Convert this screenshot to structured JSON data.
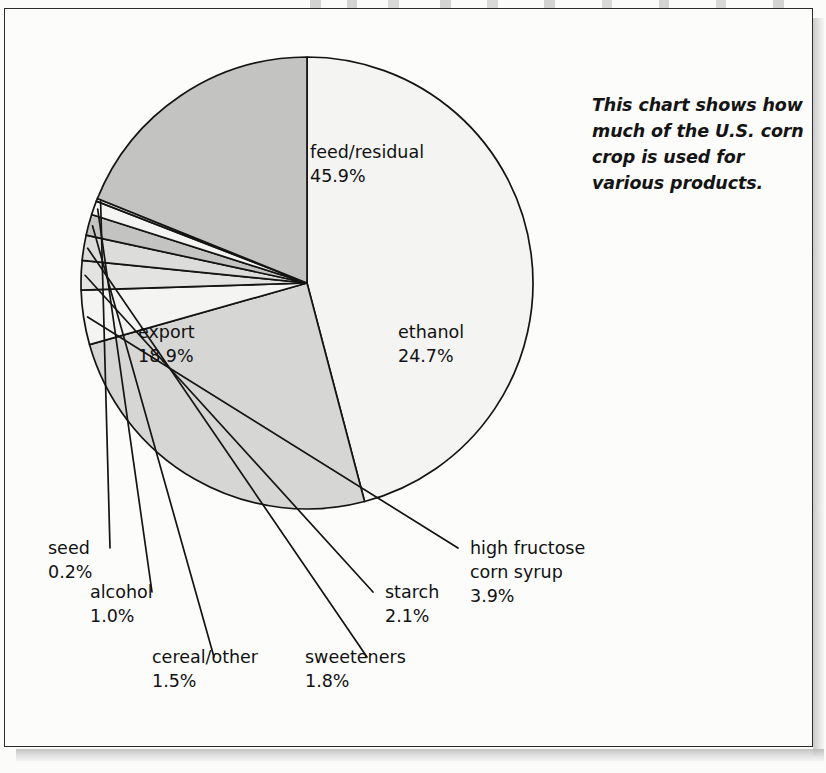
{
  "caption": {
    "text": "This chart shows how much of the U.S. corn crop is used for various products."
  },
  "chart_data": {
    "type": "pie",
    "title": "",
    "subtitle": "",
    "xlabel": "",
    "ylabel": "",
    "legend_position": "none",
    "grid": false,
    "units": "percent",
    "note": "This chart shows how much of the U.S. corn crop is used for various products.",
    "categories": [
      "feed/residual",
      "ethanol",
      "high fructose corn syrup",
      "starch",
      "sweeteners",
      "cereal/other",
      "alcohol",
      "seed",
      "export"
    ],
    "values": [
      45.9,
      24.7,
      3.9,
      2.1,
      1.8,
      1.5,
      1.0,
      0.2,
      18.9
    ],
    "slices": [
      {
        "name": "feed/residual",
        "label": "feed/residual",
        "percent": "45.9%",
        "value": 45.9,
        "fill": "#f4f4f2",
        "label_placement": "inside",
        "label_x": 310,
        "label_y": 158
      },
      {
        "name": "ethanol",
        "label": "ethanol",
        "percent": "24.7%",
        "value": 24.7,
        "fill": "#d6d6d4",
        "label_placement": "inside",
        "label_x": 398,
        "label_y": 338
      },
      {
        "name": "high-fructose-corn-syrup",
        "label": "high fructose",
        "label_line2": "corn syrup",
        "percent": "3.9%",
        "value": 3.9,
        "fill": "#f4f4f2",
        "label_placement": "callout",
        "label_x": 470,
        "label_y": 554
      },
      {
        "name": "starch",
        "label": "starch",
        "percent": "2.1%",
        "value": 2.1,
        "fill": "#e3e3e1",
        "label_placement": "callout",
        "label_x": 385,
        "label_y": 598
      },
      {
        "name": "sweeteners",
        "label": "sweeteners",
        "percent": "1.8%",
        "value": 1.8,
        "fill": "#dcdcda",
        "label_placement": "callout",
        "label_x": 305,
        "label_y": 663
      },
      {
        "name": "cereal-other",
        "label": "cereal/other",
        "percent": "1.5%",
        "value": 1.5,
        "fill": "#c3c3c1",
        "label_placement": "callout",
        "label_x": 152,
        "label_y": 663
      },
      {
        "name": "alcohol",
        "label": "alcohol",
        "percent": "1.0%",
        "value": 1.0,
        "fill": "#f4f4f2",
        "label_placement": "callout",
        "label_x": 90,
        "label_y": 598
      },
      {
        "name": "seed",
        "label": "seed",
        "percent": "0.2%",
        "value": 0.2,
        "fill": "#ededeb",
        "label_placement": "callout",
        "label_x": 48,
        "label_y": 554
      },
      {
        "name": "export",
        "label": "export",
        "percent": "18.9%",
        "value": 18.9,
        "fill": "#c3c3c1",
        "label_placement": "inside",
        "label_x": 138,
        "label_y": 338
      }
    ],
    "geometry": {
      "center_x": 307,
      "center_y": 283,
      "radius": 226
    }
  }
}
